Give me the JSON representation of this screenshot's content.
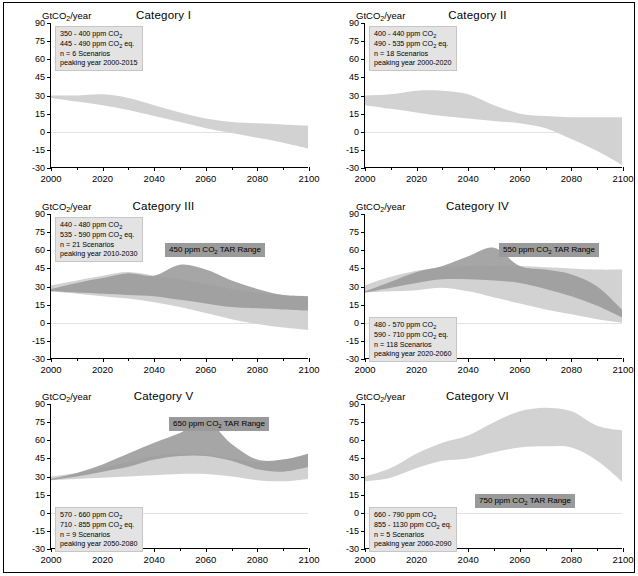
{
  "figure": {
    "units_label": "GtCO2/year",
    "units_label_parts": {
      "pre": "GtCO",
      "sub": "2",
      "post": "/year"
    },
    "x_axis": {
      "ticks": [
        2000,
        2020,
        2040,
        2060,
        2080,
        2100
      ],
      "tick_labels": [
        "2000",
        "2020",
        "2040",
        "2060",
        "2080",
        "2100"
      ],
      "min": 2000,
      "max": 2100,
      "minor_step": 10
    },
    "y_axis": {
      "ticks": [
        90,
        75,
        60,
        45,
        30,
        15,
        0,
        -15,
        -30
      ],
      "tick_labels": [
        "90",
        "75",
        "60",
        "45",
        "30",
        "15",
        "0",
        "-15",
        "-30"
      ],
      "min": -30,
      "max": 90
    },
    "colors": {
      "scenario_band": "#d2d2d2",
      "tar_band": "#9a9a9a",
      "infobox_bg": "#e3e3e3",
      "tarlabel_bg": "#9a9a9a",
      "axis": "#000000",
      "zero_line": "#e2e2e2",
      "page_bg": "#ffffff"
    }
  },
  "chart_data": [
    {
      "type": "area",
      "id": "category-1",
      "title": "Category I",
      "xlabel": "",
      "ylabel": "GtCO2/year",
      "xlim": [
        2000,
        2100
      ],
      "ylim": [
        -30,
        90
      ],
      "grid": false,
      "info": {
        "co2_range": "350 - 400 ppm CO2",
        "co2eq_range": "445 - 490 ppm CO2 eq.",
        "scenarios": "n = 6 Scenarios",
        "peaking_year": "peaking year 2000-2015"
      },
      "tar_range_label": null,
      "x": [
        2000,
        2010,
        2020,
        2030,
        2040,
        2050,
        2060,
        2070,
        2080,
        2090,
        2100
      ],
      "series": [
        {
          "name": "scenario range upper",
          "values": [
            30,
            30,
            31,
            28,
            22,
            16,
            11,
            8,
            7,
            6,
            5
          ]
        },
        {
          "name": "scenario range lower",
          "values": [
            28,
            25,
            22,
            18,
            13,
            8,
            3,
            -1,
            -5,
            -9,
            -14
          ]
        }
      ]
    },
    {
      "type": "area",
      "id": "category-2",
      "title": "Category II",
      "xlabel": "",
      "ylabel": "GtCO2/year",
      "xlim": [
        2000,
        2100
      ],
      "ylim": [
        -30,
        90
      ],
      "grid": false,
      "info": {
        "co2_range": "400 - 440 ppm CO2",
        "co2eq_range": "490 - 535 ppm CO2 eq.",
        "scenarios": "n = 18 Scenarios",
        "peaking_year": "peaking year 2000-2020"
      },
      "tar_range_label": null,
      "x": [
        2000,
        2010,
        2020,
        2030,
        2040,
        2050,
        2060,
        2070,
        2080,
        2090,
        2100
      ],
      "series": [
        {
          "name": "scenario range upper",
          "values": [
            30,
            31,
            34,
            34,
            31,
            22,
            15,
            13,
            12,
            12,
            12
          ]
        },
        {
          "name": "scenario range lower",
          "values": [
            22,
            19,
            16,
            13,
            11,
            9,
            7,
            3,
            -6,
            -16,
            -28
          ]
        }
      ]
    },
    {
      "type": "area",
      "id": "category-3",
      "title": "Category III",
      "xlabel": "",
      "ylabel": "GtCO2/year",
      "xlim": [
        2000,
        2100
      ],
      "ylim": [
        -30,
        90
      ],
      "grid": false,
      "info": {
        "co2_range": "440 - 480 ppm CO2",
        "co2eq_range": "535 - 590 ppm CO2 eq.",
        "scenarios": "n = 21 Scenarios",
        "peaking_year": "peaking year 2010-2030"
      },
      "tar_range_label": "450 ppm CO2 TAR Range",
      "x": [
        2000,
        2010,
        2020,
        2030,
        2040,
        2050,
        2060,
        2070,
        2080,
        2090,
        2100
      ],
      "series": [
        {
          "name": "scenario range upper",
          "values": [
            31,
            35,
            39,
            42,
            39,
            36,
            32,
            28,
            25,
            23,
            22
          ]
        },
        {
          "name": "scenario range lower",
          "values": [
            26,
            24,
            22,
            20,
            17,
            13,
            8,
            3,
            -1,
            -4,
            -6
          ]
        },
        {
          "name": "TAR range upper",
          "values": [
            28,
            33,
            37,
            41,
            39,
            48,
            44,
            35,
            28,
            23,
            22
          ]
        },
        {
          "name": "TAR range lower",
          "values": [
            26,
            25,
            24,
            23,
            22,
            19,
            16,
            13,
            12,
            11,
            10
          ]
        }
      ]
    },
    {
      "type": "area",
      "id": "category-4",
      "title": "Category IV",
      "xlabel": "",
      "ylabel": "GtCO2/year",
      "xlim": [
        2000,
        2100
      ],
      "ylim": [
        -30,
        90
      ],
      "grid": false,
      "info": {
        "co2_range": "480 - 570 ppm CO2",
        "co2eq_range": "590 - 710 ppm CO2 eq.",
        "scenarios": "n = 118 Scenarios",
        "peaking_year": "peaking year 2020-2060"
      },
      "tar_range_label": "550 ppm CO2 TAR Range",
      "x": [
        2000,
        2010,
        2020,
        2030,
        2040,
        2050,
        2060,
        2070,
        2080,
        2090,
        2100
      ],
      "series": [
        {
          "name": "scenario range upper",
          "values": [
            31,
            38,
            43,
            46,
            47,
            47,
            47,
            46,
            45,
            44,
            44
          ]
        },
        {
          "name": "scenario range lower",
          "values": [
            25,
            26,
            27,
            29,
            26,
            21,
            16,
            11,
            7,
            3,
            0
          ]
        },
        {
          "name": "TAR range upper",
          "values": [
            26,
            34,
            42,
            47,
            55,
            62,
            47,
            44,
            40,
            30,
            10
          ]
        },
        {
          "name": "TAR range lower",
          "values": [
            25,
            29,
            33,
            36,
            36,
            35,
            33,
            28,
            22,
            14,
            4
          ]
        }
      ]
    },
    {
      "type": "area",
      "id": "category-5",
      "title": "Category V",
      "xlabel": "",
      "ylabel": "GtCO2/year",
      "xlim": [
        2000,
        2100
      ],
      "ylim": [
        -30,
        90
      ],
      "grid": false,
      "info": {
        "co2_range": "570 - 660 ppm CO2",
        "co2eq_range": "710 - 855 ppm CO2 eq.",
        "scenarios": "n = 9 Scenarios",
        "peaking_year": "peaking year 2050-2080"
      },
      "tar_range_label": "650 ppm CO2 TAR Range",
      "x": [
        2000,
        2010,
        2020,
        2030,
        2040,
        2050,
        2060,
        2070,
        2080,
        2090,
        2100
      ],
      "series": [
        {
          "name": "scenario range upper",
          "values": [
            30,
            33,
            37,
            42,
            47,
            49,
            48,
            45,
            42,
            44,
            48
          ]
        },
        {
          "name": "scenario range lower",
          "values": [
            27,
            28,
            29,
            30,
            31,
            32,
            32,
            30,
            27,
            26,
            28
          ]
        },
        {
          "name": "TAR range upper",
          "values": [
            28,
            33,
            40,
            49,
            58,
            66,
            76,
            57,
            44,
            44,
            49
          ]
        },
        {
          "name": "TAR range lower",
          "values": [
            27,
            30,
            34,
            38,
            44,
            47,
            47,
            43,
            36,
            34,
            38
          ]
        }
      ]
    },
    {
      "type": "area",
      "id": "category-6",
      "title": "Category VI",
      "xlabel": "",
      "ylabel": "GtCO2/year",
      "xlim": [
        2000,
        2100
      ],
      "ylim": [
        -30,
        90
      ],
      "grid": false,
      "info": {
        "co2_range": "660 - 790 ppm CO2",
        "co2eq_range": "855 - 1130 ppm CO2 eq.",
        "scenarios": "n = 5 Scenarios",
        "peaking_year": "peaking year 2060-2090"
      },
      "tar_range_label": "750 ppm CO2 TAR Range",
      "x": [
        2000,
        2010,
        2020,
        2030,
        2040,
        2050,
        2060,
        2070,
        2080,
        2090,
        2100
      ],
      "series": [
        {
          "name": "scenario range upper",
          "values": [
            30,
            37,
            49,
            58,
            64,
            75,
            84,
            87,
            84,
            72,
            68
          ]
        },
        {
          "name": "scenario range lower",
          "values": [
            26,
            29,
            37,
            43,
            45,
            50,
            54,
            55,
            54,
            43,
            25
          ]
        }
      ]
    }
  ]
}
